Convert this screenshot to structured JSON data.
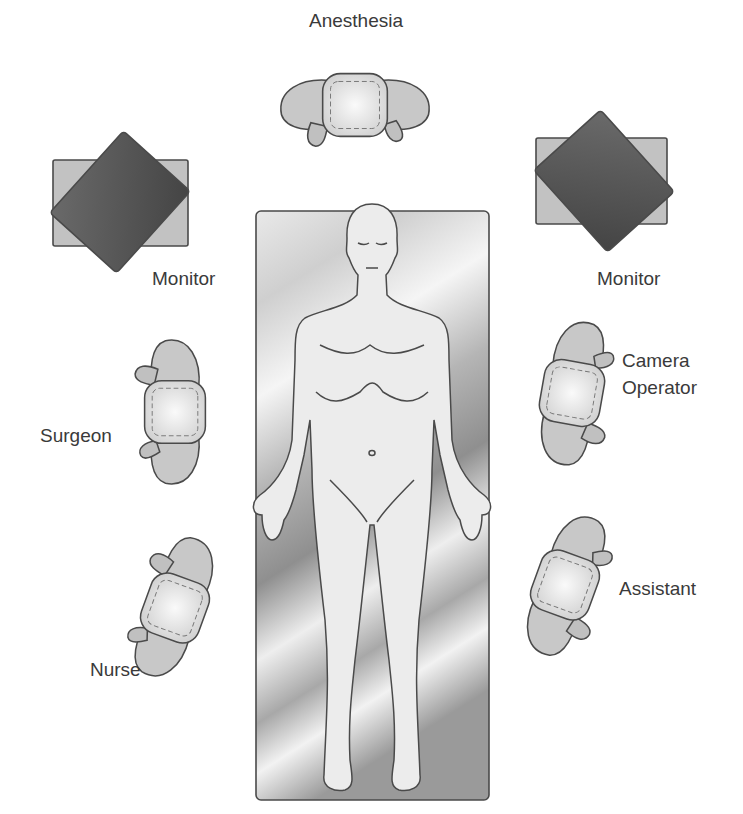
{
  "diagram": {
    "type": "operating-room-layout",
    "labels": {
      "anesthesia": "Anesthesia",
      "monitor_left": "Monitor",
      "monitor_right": "Monitor",
      "surgeon": "Surgeon",
      "camera_operator_line1": "Camera",
      "camera_operator_line2": "Operator",
      "nurse": "Nurse",
      "assistant": "Assistant"
    },
    "icons": {
      "patient": "patient-body-icon",
      "table": "operating-table-icon",
      "monitor": "monitor-icon",
      "person": "person-topview-icon"
    },
    "colors": {
      "outline": "#4a4a4a",
      "person_fill": "#c8c8c8",
      "head_fill": "#e6e6e6",
      "monitor_fill": "#555555",
      "monitor_back": "#c2c2c2",
      "table_dark": "#9a9a9a",
      "table_light": "#f0f0f0",
      "text": "#3a3a3a"
    }
  }
}
